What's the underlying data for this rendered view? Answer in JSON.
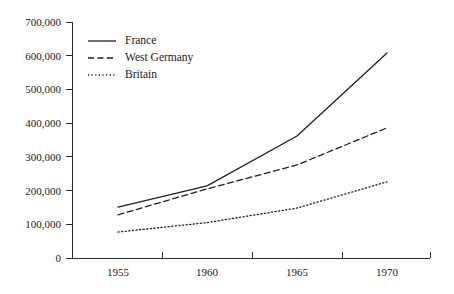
{
  "chart_data": {
    "type": "line",
    "title": "",
    "subtitle": "",
    "xlabel": "",
    "ylabel": "",
    "x": [
      1955,
      1960,
      1965,
      1970
    ],
    "categories": [
      "1955",
      "1960",
      "1965",
      "1970"
    ],
    "xtick_labels": [
      "1955",
      "1960",
      "1965",
      "1970"
    ],
    "ytick_labels": [
      "0",
      "100,000",
      "200,000",
      "300,000",
      "400,000",
      "500,000",
      "600,000",
      "700,000"
    ],
    "ytick_values": [
      0,
      100000,
      200000,
      300000,
      400000,
      500000,
      600000,
      700000
    ],
    "ylim": [
      0,
      700000
    ],
    "xlim": [
      1953.5,
      1971.5
    ],
    "grid": false,
    "legend_position": "upper-left-inside",
    "series": [
      {
        "name": "France",
        "line_style": "solid",
        "color": "#1f1f1f",
        "values": [
          151000,
          214000,
          362000,
          608000
        ]
      },
      {
        "name": "West Germany",
        "line_style": "dashed",
        "color": "#1f1f1f",
        "values": [
          128000,
          205000,
          276000,
          386000
        ]
      },
      {
        "name": "Britain",
        "line_style": "dotted",
        "color": "#1f1f1f",
        "values": [
          77000,
          105000,
          148000,
          226000
        ]
      }
    ]
  },
  "legend": {
    "items": [
      {
        "label": "France",
        "style": "solid"
      },
      {
        "label": "West Germany",
        "style": "dashed"
      },
      {
        "label": "Britain",
        "style": "dotted"
      }
    ]
  },
  "colors": {
    "ink": "#1f1f1f",
    "axis": "#2b2b2b",
    "background": "#ffffff"
  }
}
